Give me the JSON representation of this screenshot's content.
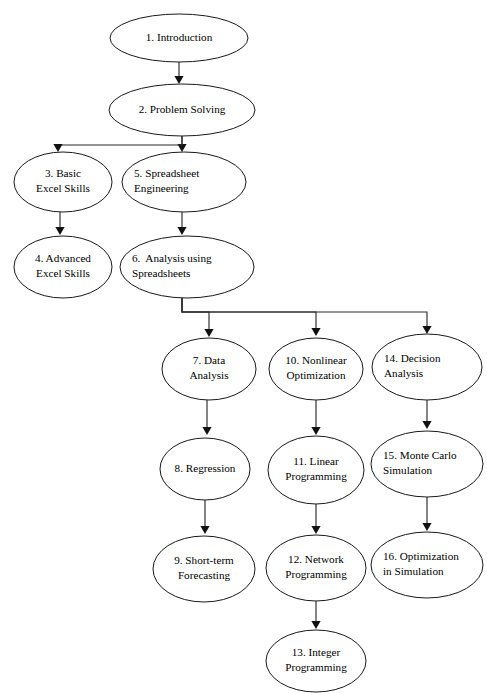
{
  "diagram": {
    "background_color": "#ffffff",
    "node_fill_color": "#ffffff",
    "node_stroke_color": "#1a1a1a",
    "edge_color": "#2b2b2b",
    "text_color": "#000000"
  },
  "nodes": [
    {
      "id": "n1",
      "name": "introduction",
      "lines": [
        "1. Introduction"
      ],
      "cx": 179,
      "cy": 38,
      "rx": 69,
      "ry": 24,
      "align": "center"
    },
    {
      "id": "n2",
      "name": "problem-solving",
      "lines": [
        "2. Problem Solving"
      ],
      "cx": 182,
      "cy": 110,
      "rx": 73,
      "ry": 26,
      "align": "center"
    },
    {
      "id": "n3",
      "name": "basic-excel-skills",
      "lines": [
        "3. Basic",
        "Excel Skills"
      ],
      "cx": 63,
      "cy": 182,
      "rx": 49,
      "ry": 30,
      "align": "center"
    },
    {
      "id": "n5",
      "name": "spreadsheet-engineering",
      "lines": [
        "5. Spreadsheet",
        "Engineering"
      ],
      "cx": 184,
      "cy": 182,
      "rx": 62,
      "ry": 30,
      "align": "left"
    },
    {
      "id": "n4",
      "name": "advanced-excel-skills",
      "lines": [
        "4. Advanced",
        "Excel Skills"
      ],
      "cx": 63,
      "cy": 267,
      "rx": 49,
      "ry": 31,
      "align": "center"
    },
    {
      "id": "n6",
      "name": "analysis-using-spreadsheets",
      "lines": [
        "6.  Analysis using",
        "Spreadsheets"
      ],
      "cx": 187,
      "cy": 267,
      "rx": 67,
      "ry": 31,
      "align": "left"
    },
    {
      "id": "n7",
      "name": "data-analysis",
      "lines": [
        "7. Data",
        "Analysis"
      ],
      "cx": 209,
      "cy": 369,
      "rx": 47,
      "ry": 31,
      "align": "center"
    },
    {
      "id": "n10",
      "name": "nonlinear-optimization",
      "lines": [
        "10. Nonlinear",
        "Optimization"
      ],
      "cx": 316,
      "cy": 369,
      "rx": 47,
      "ry": 31,
      "align": "center"
    },
    {
      "id": "n14",
      "name": "decision-analysis",
      "lines": [
        "14. Decision",
        "Analysis"
      ],
      "cx": 427,
      "cy": 367,
      "rx": 55,
      "ry": 33,
      "align": "left"
    },
    {
      "id": "n8",
      "name": "regression",
      "lines": [
        "8. Regression"
      ],
      "cx": 205,
      "cy": 469,
      "rx": 45,
      "ry": 31,
      "align": "center"
    },
    {
      "id": "n11",
      "name": "linear-programming",
      "lines": [
        "11. Linear",
        "Programming"
      ],
      "cx": 316,
      "cy": 470,
      "rx": 48,
      "ry": 34,
      "align": "center"
    },
    {
      "id": "n15",
      "name": "monte-carlo-simulation",
      "lines": [
        "15. Monte Carlo",
        "Simulation"
      ],
      "cx": 427,
      "cy": 464,
      "rx": 56,
      "ry": 33,
      "align": "left"
    },
    {
      "id": "n9",
      "name": "short-term-forecasting",
      "lines": [
        "9. Short-term",
        "Forecasting"
      ],
      "cx": 204,
      "cy": 569,
      "rx": 51,
      "ry": 33,
      "align": "center"
    },
    {
      "id": "n12",
      "name": "network-programming",
      "lines": [
        "12. Network",
        "Programming"
      ],
      "cx": 316,
      "cy": 568,
      "rx": 50,
      "ry": 33,
      "align": "center"
    },
    {
      "id": "n16",
      "name": "optimization-in-simulation",
      "lines": [
        "16. Optimization",
        "in Simulation"
      ],
      "cx": 427,
      "cy": 565,
      "rx": 56,
      "ry": 33,
      "align": "left"
    },
    {
      "id": "n13",
      "name": "integer-programming",
      "lines": [
        "13. Integer",
        "Programming"
      ],
      "cx": 316,
      "cy": 661,
      "rx": 50,
      "ry": 31,
      "align": "center"
    }
  ],
  "edges": [
    {
      "name": "edge-1-to-2",
      "from": "n1",
      "to": "n2",
      "path": "M 179 62 L 179 80",
      "head_x": 179,
      "head_y": 84
    },
    {
      "name": "edge-2-to-5",
      "from": "n2",
      "to": "n5",
      "path": "M 182 136 L 182 148",
      "head_x": 182,
      "head_y": 152
    },
    {
      "name": "edge-2-to-3",
      "from": "n2",
      "to": "n3",
      "path": "M 182 136 L 182 145 L 58 145 L 58 148",
      "head_x": 58,
      "head_y": 152
    },
    {
      "name": "edge-3-to-4",
      "from": "n3",
      "to": "n4",
      "path": "M 60 212 L 60 230",
      "head_x": 60,
      "head_y": 235
    },
    {
      "name": "edge-5-to-6",
      "from": "n5",
      "to": "n6",
      "path": "M 182 212 L 182 230",
      "head_x": 182,
      "head_y": 235
    },
    {
      "name": "edge-6-to-7",
      "from": "n6",
      "to": "n7",
      "path": "M 182 298 L 182 312 L 209 312 L 209 332",
      "head_x": 209,
      "head_y": 337
    },
    {
      "name": "edge-6-to-10",
      "from": "n6",
      "to": "n10",
      "path": "M 182 298 L 182 312 L 316 312 L 316 331",
      "head_x": 316,
      "head_y": 336
    },
    {
      "name": "edge-6-to-14",
      "from": "n6",
      "to": "n14",
      "path": "M 182 298 L 182 312 L 427 312 L 427 329",
      "head_x": 427,
      "head_y": 334
    },
    {
      "name": "edge-7-to-8",
      "from": "n7",
      "to": "n8",
      "path": "M 207 400 L 207 430",
      "head_x": 207,
      "head_y": 435
    },
    {
      "name": "edge-10-to-11",
      "from": "n10",
      "to": "n11",
      "path": "M 316 400 L 316 430",
      "head_x": 316,
      "head_y": 435
    },
    {
      "name": "edge-14-to-15",
      "from": "n14",
      "to": "n15",
      "path": "M 427 400 L 427 424",
      "head_x": 427,
      "head_y": 429
    },
    {
      "name": "edge-8-to-9",
      "from": "n8",
      "to": "n9",
      "path": "M 205 500 L 205 529",
      "head_x": 205,
      "head_y": 534
    },
    {
      "name": "edge-11-to-12",
      "from": "n11",
      "to": "n12",
      "path": "M 316 504 L 316 529",
      "head_x": 316,
      "head_y": 534
    },
    {
      "name": "edge-15-to-16",
      "from": "n15",
      "to": "n16",
      "path": "M 427 497 L 427 526",
      "head_x": 427,
      "head_y": 531
    },
    {
      "name": "edge-12-to-13",
      "from": "n12",
      "to": "n13",
      "path": "M 316 601 L 316 624",
      "head_x": 316,
      "head_y": 629
    }
  ]
}
